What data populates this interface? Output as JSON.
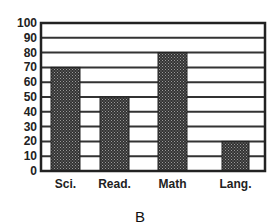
{
  "chart_data": {
    "type": "bar",
    "title": "",
    "caption": "B",
    "xlabel": "",
    "ylabel": "",
    "categories": [
      "Sci.",
      "Read.",
      "Math",
      "Lang."
    ],
    "values": [
      70,
      50,
      80,
      20
    ],
    "ylim": [
      0,
      100
    ],
    "yticks": [
      0,
      10,
      20,
      30,
      40,
      50,
      60,
      70,
      80,
      90,
      100
    ],
    "grid": true,
    "legend": null,
    "bar_fill": "dotted dark gray pattern"
  },
  "layout": {
    "plot": {
      "left": 41,
      "right": 265,
      "top": 23,
      "bottom": 171
    },
    "bars": [
      {
        "x": 51,
        "w": 29
      },
      {
        "x": 100,
        "w": 29
      },
      {
        "x": 158,
        "w": 29
      },
      {
        "x": 222,
        "w": 27
      }
    ],
    "colors": {
      "axis": "#222222",
      "grid": "#333333",
      "bar": "#3a3a3a",
      "bar_dot": "#9a9a9a"
    }
  }
}
